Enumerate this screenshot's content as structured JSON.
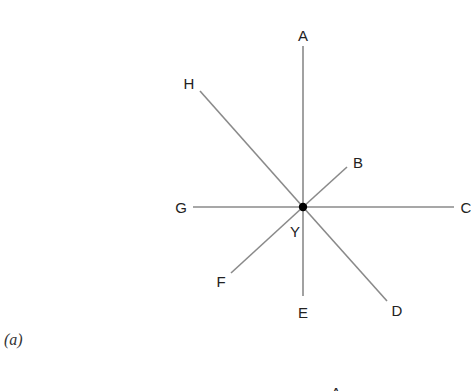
{
  "figure": {
    "caption": "(a)",
    "center": {
      "label": "Y",
      "x": 303,
      "y": 207,
      "dot_radius": 4.2
    },
    "line_color": "#8a8a8a",
    "dot_color": "#000000",
    "rays": [
      {
        "id": "A",
        "label": "A",
        "x2": 303,
        "y2": 46,
        "lx": 303,
        "ly": 41
      },
      {
        "id": "B",
        "label": "B",
        "x2": 347,
        "y2": 167,
        "lx": 358,
        "ly": 168
      },
      {
        "id": "C",
        "label": "C",
        "x2": 454,
        "y2": 207,
        "lx": 466,
        "ly": 213
      },
      {
        "id": "D",
        "label": "D",
        "x2": 387,
        "y2": 301,
        "lx": 397,
        "ly": 316
      },
      {
        "id": "E",
        "label": "E",
        "x2": 303,
        "y2": 296,
        "lx": 303,
        "ly": 318
      },
      {
        "id": "F",
        "label": "F",
        "x2": 231,
        "y2": 273,
        "lx": 221,
        "ly": 287
      },
      {
        "id": "G",
        "label": "G",
        "x2": 193,
        "y2": 207,
        "lx": 181,
        "ly": 213
      },
      {
        "id": "H",
        "label": "H",
        "x2": 200,
        "y2": 91,
        "lx": 189,
        "ly": 89
      }
    ],
    "next_figure_partial_label": "A"
  }
}
